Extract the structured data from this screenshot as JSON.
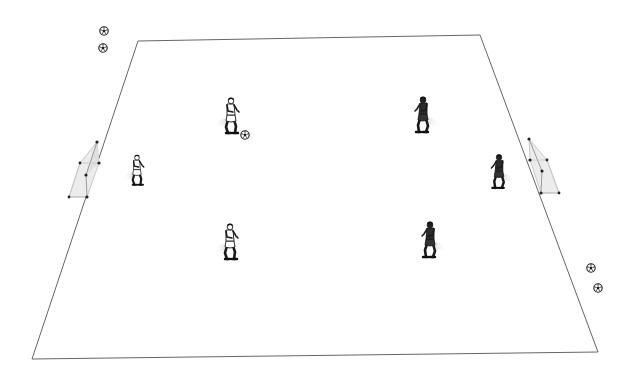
{
  "diagram": {
    "title": "",
    "type": "soccer-training-drill",
    "pitch": {
      "line_color": "#555555",
      "fill_color": "#ffffff"
    },
    "goals": [
      {
        "id": "left-goal",
        "side": "left"
      },
      {
        "id": "right-goal",
        "side": "right"
      }
    ],
    "players": [
      {
        "id": "white-goalkeeper",
        "team": "white",
        "role": "goalkeeper",
        "side": "left"
      },
      {
        "id": "white-player-top",
        "team": "white",
        "role": "field-player",
        "has_ball": true
      },
      {
        "id": "white-player-bottom",
        "team": "white",
        "role": "field-player"
      },
      {
        "id": "dark-player-top",
        "team": "dark",
        "role": "field-player"
      },
      {
        "id": "dark-player-bottom",
        "team": "dark",
        "role": "field-player"
      },
      {
        "id": "dark-goalkeeper",
        "team": "dark",
        "role": "goalkeeper",
        "side": "right"
      }
    ],
    "spare_balls": [
      {
        "id": "ball-top-left-1"
      },
      {
        "id": "ball-top-left-2"
      },
      {
        "id": "ball-bottom-right-1"
      },
      {
        "id": "ball-bottom-right-2"
      }
    ],
    "colors": {
      "white_team_shirt": "#ffffff",
      "dark_team_shirt": "#2b2b2b",
      "outline": "#1a1a1a",
      "goal_net": "#e6e6e6",
      "goal_post": "#222222",
      "shadow": "#d8d8d8"
    }
  }
}
